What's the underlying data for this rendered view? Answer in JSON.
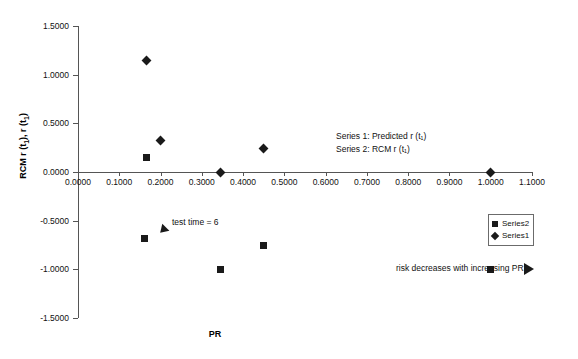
{
  "chart_data": {
    "type": "scatter",
    "title": "",
    "xlabel": "PR",
    "ylabel": "RCM r (t₁), r (t₁)",
    "xlim": [
      0.0,
      1.1
    ],
    "ylim": [
      -1.5,
      1.5
    ],
    "grid": false,
    "legend_position": "right-inside",
    "xticks": [
      "0.0000",
      "0.1000",
      "0.2000",
      "0.3000",
      "0.4000",
      "0.5000",
      "0.6000",
      "0.7000",
      "0.8000",
      "0.9000",
      "1.0000",
      "1.1000"
    ],
    "xtick_values": [
      0.0,
      0.1,
      0.2,
      0.3,
      0.4,
      0.5,
      0.6,
      0.7,
      0.8,
      0.9,
      1.0,
      1.1
    ],
    "yticks": [
      "1.5000",
      "1.0000",
      "0.5000",
      "0.0000",
      "-0.5000",
      "-1.0000",
      "-1.5000"
    ],
    "ytick_values": [
      1.5,
      1.0,
      0.5,
      0.0,
      -0.5,
      -1.0,
      -1.5
    ],
    "series": [
      {
        "name": "Series1",
        "marker": "diamond",
        "color": "#1a1a1a",
        "description": "Predicted r (t₁)",
        "points": [
          {
            "x": 0.165,
            "y": 1.15
          },
          {
            "x": 0.2,
            "y": 0.32
          },
          {
            "x": 0.345,
            "y": 0.0
          },
          {
            "x": 0.45,
            "y": 0.24
          },
          {
            "x": 1.0,
            "y": 0.0
          }
        ]
      },
      {
        "name": "Series2",
        "marker": "square",
        "color": "#1a1a1a",
        "description": "RCM r (t₁)",
        "points": [
          {
            "x": 0.165,
            "y": 0.15
          },
          {
            "x": 0.16,
            "y": -0.68
          },
          {
            "x": 0.345,
            "y": -1.0
          },
          {
            "x": 0.45,
            "y": -0.75
          },
          {
            "x": 1.0,
            "y": -1.0
          }
        ]
      }
    ],
    "annotations": [
      {
        "name": "series-note-1",
        "text": "Series 1: Predicted r (t₁)"
      },
      {
        "name": "series-note-2",
        "text": "Series 2: RCM r (t₁)"
      },
      {
        "name": "test-time-note",
        "text": "test time = 6"
      },
      {
        "name": "risk-note",
        "text": "risk decreases with increasing PR"
      }
    ]
  },
  "legend": {
    "entries": [
      {
        "label": "Series2",
        "marker": "square"
      },
      {
        "label": "Series1",
        "marker": "diamond"
      }
    ]
  },
  "axis_titles": {
    "x": "PR",
    "y_main": "RCM r (t",
    "y_sub1": "1",
    "y_mid": "), r (t",
    "y_sub2": "1",
    "y_end": ")"
  },
  "notes": {
    "series1": "Series 1: Predicted r (t₁)",
    "series2": "Series 2: RCM r (t₁)",
    "test_time": "test time = 6",
    "risk": "risk decreases with increasing PR"
  },
  "colors": {
    "marker": "#1a1a1a",
    "axis": "#555555",
    "text": "#111111",
    "background": "#ffffff"
  }
}
